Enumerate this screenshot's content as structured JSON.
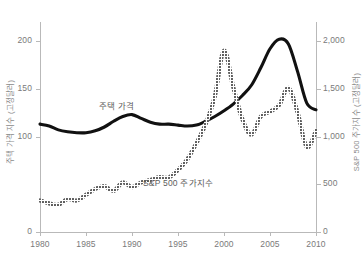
{
  "chart_data": {
    "type": "line",
    "title": "",
    "xlabel": "",
    "ylabel": "주택 가격 지수 (고정달러)",
    "y2label": "S&P 500 주가지수 (고정달러)",
    "grid": false,
    "legend": "in-plot annotations",
    "xlim": [
      1980,
      2010
    ],
    "ylim": [
      0,
      220
    ],
    "y2lim": [
      0,
      2200
    ],
    "x_ticks": [
      "1980",
      "1985",
      "1990",
      "1995",
      "2000",
      "2005",
      "2010"
    ],
    "x_tick_values": [
      1980,
      1985,
      1990,
      1995,
      2000,
      2005,
      2010
    ],
    "y_ticks": [
      "0",
      "100",
      "150",
      "200"
    ],
    "y_tick_values": [
      0,
      100,
      150,
      200
    ],
    "y2_ticks": [
      "0",
      "500",
      "1,000",
      "1,500",
      "2,000"
    ],
    "y2_tick_values": [
      0,
      500,
      1000,
      1500,
      2000
    ],
    "series": [
      {
        "name": "주택 가격",
        "axis": "left",
        "style": "solid-thick",
        "color": "#111111",
        "x": [
          1980,
          1981,
          1982,
          1983,
          1984,
          1985,
          1986,
          1987,
          1988,
          1989,
          1990,
          1991,
          1992,
          1993,
          1994,
          1995,
          1996,
          1997,
          1998,
          1999,
          2000,
          2001,
          2002,
          2003,
          2004,
          2005,
          2006,
          2007,
          2008,
          2009,
          2010
        ],
        "values": [
          113,
          111,
          107,
          105,
          104,
          104,
          106,
          110,
          116,
          121,
          123,
          119,
          115,
          113,
          113,
          112,
          111,
          112,
          116,
          121,
          127,
          134,
          143,
          154,
          172,
          192,
          202,
          197,
          168,
          135,
          128
        ]
      },
      {
        "name": "S&P 500 주가지수",
        "axis": "right",
        "style": "dotted",
        "color": "#222222",
        "x": [
          1980,
          1981,
          1982,
          1983,
          1984,
          1985,
          1986,
          1987,
          1988,
          1989,
          1990,
          1991,
          1992,
          1993,
          1994,
          1995,
          1996,
          1997,
          1998,
          1999,
          2000,
          2001,
          2002,
          2003,
          2004,
          2005,
          2006,
          2007,
          2008,
          2009,
          2010
        ],
        "values": [
          330,
          300,
          285,
          345,
          330,
          390,
          450,
          480,
          430,
          520,
          470,
          520,
          545,
          575,
          570,
          650,
          760,
          930,
          1130,
          1420,
          1900,
          1520,
          1180,
          1020,
          1210,
          1260,
          1330,
          1510,
          1250,
          890,
          1060
        ]
      }
    ],
    "annotations": [
      {
        "text": "주택 가격",
        "x": 1990,
        "y": 140,
        "series": "주택 가격"
      },
      {
        "text": "S&P 500 주가지수",
        "x": 1995,
        "y": 60,
        "series": "S&P 500 주가지수"
      }
    ]
  }
}
